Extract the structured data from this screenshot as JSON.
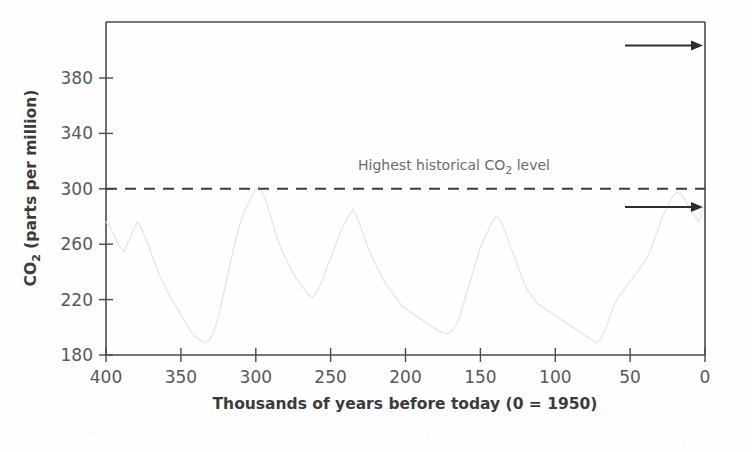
{
  "chart_data": {
    "type": "line",
    "title": "",
    "xlabel": "Thousands of years before today (0 = 1950)",
    "ylabel": "CO2 (parts per million)",
    "ylabel_main": "CO",
    "ylabel_sub": "2",
    "ylabel_rest": " (parts per million)",
    "xlim": [
      400,
      0
    ],
    "ylim": [
      180,
      400
    ],
    "x_reversed": true,
    "grid": false,
    "legend": "none",
    "xticks": [
      400,
      350,
      300,
      250,
      200,
      150,
      100,
      50,
      0
    ],
    "yticks": [
      180,
      220,
      260,
      300,
      340,
      380
    ],
    "annotations": [
      {
        "name": "highest-historical-level",
        "text_prefix": "Highest historical CO",
        "text_sub": "2",
        "text_suffix": " level",
        "full_text": "Highest historical CO2 level",
        "value": 300,
        "style": "dashed-horizontal-line"
      },
      {
        "name": "upper-arrow",
        "direction": "right",
        "y_value": 390
      },
      {
        "name": "lower-arrow",
        "direction": "right",
        "y_value": 281
      }
    ],
    "series": [
      {
        "name": "Ice core CO2 record",
        "color": "#e3e3e6",
        "x": [
          400,
          397,
          394,
          391,
          388,
          385,
          382,
          379,
          376,
          373,
          370,
          367,
          364,
          361,
          358,
          355,
          352,
          349,
          346,
          343,
          340,
          337,
          334,
          331,
          328,
          325,
          322,
          319,
          316,
          313,
          310,
          307,
          304,
          301,
          298,
          295,
          292,
          289,
          286,
          283,
          280,
          277,
          274,
          271,
          268,
          265,
          262,
          259,
          256,
          253,
          250,
          247,
          244,
          241,
          238,
          235,
          232,
          229,
          226,
          223,
          220,
          217,
          214,
          211,
          208,
          205,
          202,
          199,
          196,
          193,
          190,
          187,
          184,
          181,
          178,
          175,
          172,
          169,
          166,
          163,
          160,
          157,
          154,
          151,
          148,
          145,
          142,
          139,
          136,
          133,
          130,
          127,
          124,
          121,
          118,
          115,
          112,
          109,
          106,
          103,
          100,
          97,
          94,
          91,
          88,
          85,
          82,
          79,
          76,
          73,
          70,
          67,
          64,
          61,
          58,
          55,
          52,
          49,
          46,
          43,
          40,
          37,
          34,
          31,
          28,
          25,
          22,
          19,
          16,
          13,
          10,
          7,
          4,
          1
        ],
        "y": [
          268,
          264,
          258,
          252,
          248,
          255,
          262,
          268,
          263,
          256,
          248,
          240,
          232,
          226,
          220,
          215,
          210,
          205,
          200,
          195,
          192,
          190,
          188,
          190,
          195,
          205,
          218,
          232,
          245,
          258,
          268,
          276,
          282,
          288,
          292,
          286,
          278,
          268,
          258,
          250,
          244,
          238,
          232,
          228,
          224,
          220,
          218,
          222,
          228,
          236,
          244,
          252,
          260,
          266,
          272,
          276,
          270,
          262,
          254,
          246,
          240,
          234,
          228,
          224,
          220,
          216,
          212,
          210,
          208,
          206,
          204,
          202,
          200,
          198,
          196,
          195,
          194,
          196,
          200,
          208,
          218,
          228,
          238,
          248,
          256,
          262,
          268,
          272,
          268,
          260,
          252,
          244,
          236,
          228,
          222,
          218,
          214,
          212,
          210,
          208,
          206,
          204,
          202,
          200,
          198,
          196,
          194,
          192,
          190,
          188,
          190,
          196,
          204,
          212,
          218,
          222,
          226,
          230,
          234,
          238,
          242,
          248,
          256,
          264,
          272,
          278,
          284,
          288,
          286,
          282,
          276,
          272,
          268,
          278
        ],
        "note": "Vostok/EPICA-style ice-core CO2 record, 400 kyr BP to present, glacial-interglacial cycles between ~180 and ~300 ppm"
      }
    ]
  },
  "geometry": {
    "plot_left": 106,
    "plot_right": 705,
    "plot_top": 22,
    "plot_bottom": 355
  }
}
